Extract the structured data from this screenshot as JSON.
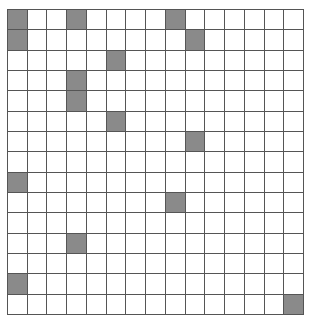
{
  "grid": {
    "rows": 15,
    "cols": 15,
    "colors": {
      "filled": "#8a8a8a",
      "empty": "#ffffff",
      "line": "#555555"
    },
    "filled_cells": [
      [
        0,
        0
      ],
      [
        0,
        3
      ],
      [
        0,
        8
      ],
      [
        1,
        0
      ],
      [
        1,
        9
      ],
      [
        2,
        5
      ],
      [
        3,
        3
      ],
      [
        4,
        3
      ],
      [
        5,
        5
      ],
      [
        6,
        9
      ],
      [
        8,
        0
      ],
      [
        9,
        8
      ],
      [
        11,
        3
      ],
      [
        13,
        0
      ],
      [
        14,
        14
      ]
    ]
  }
}
